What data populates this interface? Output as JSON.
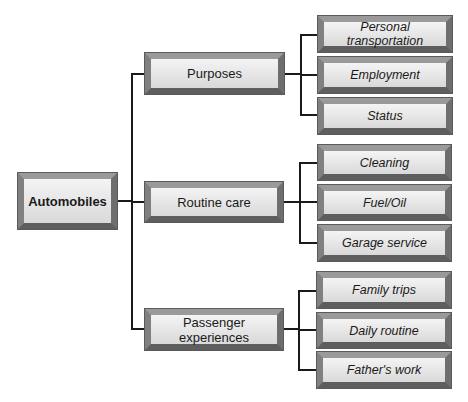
{
  "diagram": {
    "type": "tree",
    "root": {
      "label": "Automobiles"
    },
    "branches": [
      {
        "label": "Purposes",
        "children": [
          {
            "label": "Personal transportation"
          },
          {
            "label": "Employment"
          },
          {
            "label": "Status"
          }
        ]
      },
      {
        "label": "Routine care",
        "children": [
          {
            "label": "Cleaning"
          },
          {
            "label": "Fuel/Oil"
          },
          {
            "label": "Garage service"
          }
        ]
      },
      {
        "label": "Passenger experiences",
        "children": [
          {
            "label": "Family trips"
          },
          {
            "label": "Daily routine"
          },
          {
            "label": "Father's work"
          }
        ]
      }
    ]
  }
}
